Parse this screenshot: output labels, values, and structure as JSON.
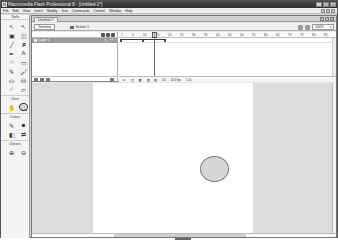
{
  "window": {
    "title": "Macromedia Flash Professional 8 - [Untitled-1*]",
    "controls": [
      "_",
      "□",
      "x"
    ]
  },
  "menubar": {
    "items": [
      "File",
      "Edit",
      "View",
      "Insert",
      "Modify",
      "Text",
      "Commands",
      "Control",
      "Window",
      "Help"
    ]
  },
  "toolbox": {
    "header": "Tools",
    "tools": [
      {
        "name": "selection-tool",
        "glyph": "↖"
      },
      {
        "name": "subselection-tool",
        "glyph": "↖"
      },
      {
        "name": "free-transform-tool",
        "glyph": "▣"
      },
      {
        "name": "fill-transform-tool",
        "glyph": "◫"
      },
      {
        "name": "line-tool",
        "glyph": "╱"
      },
      {
        "name": "lasso-tool",
        "glyph": "ᑭ"
      },
      {
        "name": "pen-tool",
        "glyph": "✒"
      },
      {
        "name": "text-tool",
        "glyph": "A"
      },
      {
        "name": "oval-tool",
        "glyph": "○"
      },
      {
        "name": "rectangle-tool",
        "glyph": "▭"
      },
      {
        "name": "pencil-tool",
        "glyph": "✎"
      },
      {
        "name": "brush-tool",
        "glyph": "🖌"
      },
      {
        "name": "ink-bottle-tool",
        "glyph": "⛀"
      },
      {
        "name": "paint-bucket-tool",
        "glyph": "⛁"
      },
      {
        "name": "eyedropper-tool",
        "glyph": "⁄"
      },
      {
        "name": "eraser-tool",
        "glyph": "▱"
      }
    ],
    "view_section": "View",
    "view_tools": [
      {
        "name": "hand-tool",
        "glyph": "✋"
      },
      {
        "name": "zoom-tool",
        "glyph": "🔍",
        "selected": true
      }
    ],
    "colors_section": "Colors",
    "color_tools": [
      {
        "name": "stroke-color",
        "glyph": "✎"
      },
      {
        "name": "fill-color",
        "glyph": "■"
      },
      {
        "name": "black-white",
        "glyph": "◧"
      },
      {
        "name": "swap-colors",
        "glyph": "⇄"
      }
    ],
    "options_section": "Options",
    "option_tools": [
      {
        "name": "enlarge",
        "glyph": "⊕"
      },
      {
        "name": "reduce",
        "glyph": "⊖"
      }
    ]
  },
  "document": {
    "tab": "Untitled-1*",
    "timeline_button": "Timeline",
    "scene": "Scene 1",
    "zoom": "100%"
  },
  "timeline": {
    "layers": [
      {
        "name": "Layer 1"
      }
    ],
    "frame_numbers": [
      "1",
      "5",
      "10",
      "15",
      "20",
      "25",
      "30",
      "35",
      "40",
      "45",
      "50",
      "55",
      "60",
      "65",
      "70",
      "75",
      "80",
      "85"
    ],
    "current_frame": "14",
    "frame_rate": "12.0 fps",
    "elapsed_time": "1.1s"
  },
  "stage": {
    "shape": "oval",
    "fill_color": "#d6d6d6",
    "stroke_color": "#777777"
  }
}
